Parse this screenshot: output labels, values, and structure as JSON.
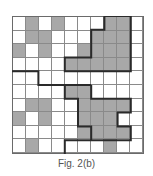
{
  "figure": {
    "caption": "Fig. 2(b)",
    "rows": 10,
    "cols": 10,
    "colors": {
      "shaded": "#a8a8a8",
      "empty": "#ffffff",
      "grid_line": "#8a8a8a",
      "thick_line": "#2a2a2a",
      "caption": "#555555"
    },
    "cells": [
      [
        0,
        1,
        0,
        1,
        0,
        0,
        0,
        1,
        1,
        0
      ],
      [
        0,
        1,
        1,
        0,
        0,
        0,
        1,
        1,
        1,
        0
      ],
      [
        1,
        0,
        1,
        0,
        0,
        1,
        1,
        1,
        1,
        0
      ],
      [
        0,
        0,
        0,
        0,
        1,
        1,
        1,
        1,
        1,
        0
      ],
      [
        0,
        0,
        0,
        0,
        0,
        0,
        0,
        0,
        0,
        0
      ],
      [
        0,
        0,
        0,
        0,
        1,
        1,
        0,
        0,
        0,
        0
      ],
      [
        0,
        1,
        1,
        0,
        0,
        1,
        1,
        1,
        1,
        0
      ],
      [
        1,
        0,
        1,
        0,
        0,
        1,
        1,
        1,
        0,
        0
      ],
      [
        0,
        0,
        0,
        0,
        0,
        1,
        1,
        1,
        1,
        0
      ],
      [
        0,
        1,
        0,
        0,
        0,
        0,
        0,
        1,
        0,
        0
      ]
    ],
    "thick_paths": [
      [
        [
          7,
          0
        ],
        [
          9,
          0
        ],
        [
          9,
          4
        ],
        [
          4,
          4
        ],
        [
          4,
          3
        ],
        [
          6,
          3
        ],
        [
          6,
          1
        ],
        [
          7,
          1
        ],
        [
          7,
          0
        ]
      ],
      [
        [
          0,
          4
        ],
        [
          2,
          4
        ],
        [
          2,
          5
        ],
        [
          6,
          5
        ]
      ],
      [
        [
          4,
          5
        ],
        [
          4,
          6
        ],
        [
          5,
          6
        ],
        [
          5,
          8
        ],
        [
          6,
          8
        ],
        [
          6,
          9
        ]
      ],
      [
        [
          4,
          10
        ],
        [
          4,
          9
        ],
        [
          9,
          9
        ],
        [
          9,
          8
        ],
        [
          8,
          8
        ],
        [
          8,
          7
        ],
        [
          9,
          7
        ],
        [
          9,
          6
        ],
        [
          6,
          6
        ],
        [
          6,
          5
        ]
      ]
    ]
  }
}
